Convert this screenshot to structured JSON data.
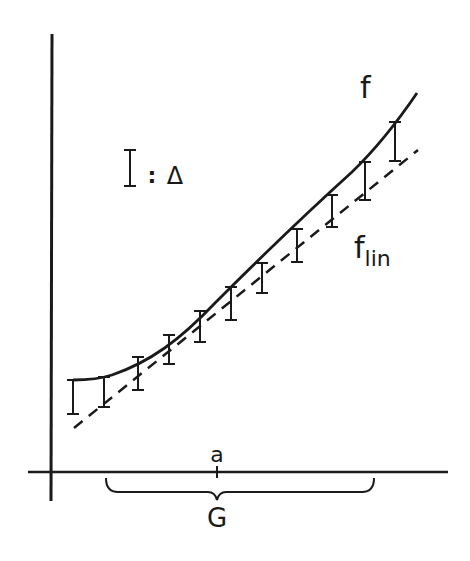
{
  "diagram": {
    "type": "function-approximation-sketch",
    "ink_color": "#1a1a1a",
    "background_color": "#ffffff",
    "labels": {
      "curve_f": "f",
      "curve_flin_main": "f",
      "curve_flin_sub": "lin",
      "point_a": "a",
      "region_G": "G",
      "legend_symbol_colon": ":",
      "legend_delta": "Δ"
    },
    "legend": {
      "meaning": "error bar I denotes tolerance Δ"
    },
    "curves": [
      {
        "name": "f",
        "style": "solid",
        "description": "nonlinear function, convex"
      },
      {
        "name": "f_lin",
        "style": "dashed",
        "description": "linearization tangent at a"
      }
    ],
    "error_bar_count": 11
  }
}
